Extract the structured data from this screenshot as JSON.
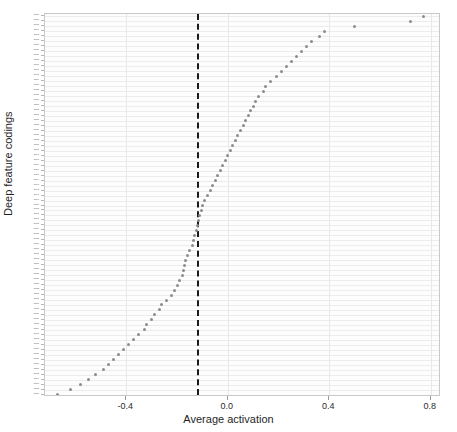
{
  "chart_data": {
    "type": "scatter",
    "title": "",
    "xlabel": "Average activation",
    "ylabel": "Deep feature codings",
    "xlim": [
      -0.72,
      0.84
    ],
    "grid": true,
    "legend": null,
    "xticks": [
      -0.4,
      0.0,
      0.4,
      0.8
    ],
    "xticklabels": [
      "-0.4",
      "0.0",
      "0.4",
      "0.8"
    ],
    "annotations": [
      {
        "type": "vline",
        "x": -0.12,
        "style": "dashed",
        "color": "#1a1a1a",
        "label": ""
      }
    ],
    "orientation": "horizontal",
    "marker": {
      "shape": "circle",
      "color": "#8b8b90",
      "size": 3
    },
    "categories": [
      "DFC77",
      "DFC76",
      "DFC75",
      "DFC74",
      "DFC73",
      "DFC72",
      "DFC71",
      "DFC70",
      "DFC69",
      "DFC68",
      "DFC67",
      "DFC66",
      "DFC65",
      "DFC64",
      "DFC63",
      "DFC62",
      "DFC61",
      "DFC60",
      "DFC59",
      "DFC58",
      "DFC57",
      "DFC56",
      "DFC55",
      "DFC54",
      "DFC53",
      "DFC52",
      "DFC51",
      "DFC50",
      "DFC49",
      "DFC48",
      "DFC47",
      "DFC46",
      "DFC45",
      "DFC44",
      "DFC43",
      "DFC42",
      "DFC41",
      "DFC40",
      "DFC39",
      "DFC38",
      "DFC37",
      "DFC36",
      "DFC35",
      "DFC34",
      "DFC33",
      "DFC32",
      "DFC31",
      "DFC30",
      "DFC29",
      "DFC28",
      "DFC27",
      "DFC26",
      "DFC25",
      "DFC24",
      "DFC23",
      "DFC22",
      "DFC21",
      "DFC20",
      "DFC19",
      "DFC18",
      "DFC17",
      "DFC16",
      "DFC15",
      "DFC14",
      "DFC13",
      "DFC12",
      "DFC11",
      "DFC10",
      "DFC09",
      "DFC08",
      "DFC07",
      "DFC06",
      "DFC05",
      "DFC04",
      "DFC03",
      "DFC02",
      "DFC01"
    ],
    "values": [
      0.77,
      0.72,
      0.5,
      0.38,
      0.36,
      0.33,
      0.31,
      0.29,
      0.27,
      0.25,
      0.23,
      0.21,
      0.19,
      0.17,
      0.15,
      0.14,
      0.12,
      0.11,
      0.1,
      0.09,
      0.08,
      0.07,
      0.06,
      0.05,
      0.04,
      0.03,
      0.02,
      0.01,
      0.0,
      -0.01,
      -0.02,
      -0.03,
      -0.04,
      -0.05,
      -0.06,
      -0.07,
      -0.08,
      -0.09,
      -0.1,
      -0.105,
      -0.11,
      -0.115,
      -0.12,
      -0.125,
      -0.13,
      -0.135,
      -0.14,
      -0.15,
      -0.16,
      -0.165,
      -0.17,
      -0.175,
      -0.18,
      -0.19,
      -0.2,
      -0.21,
      -0.22,
      -0.24,
      -0.26,
      -0.27,
      -0.29,
      -0.3,
      -0.32,
      -0.33,
      -0.35,
      -0.37,
      -0.39,
      -0.41,
      -0.43,
      -0.45,
      -0.47,
      -0.49,
      -0.52,
      -0.55,
      -0.58,
      -0.62,
      -0.67
    ]
  }
}
